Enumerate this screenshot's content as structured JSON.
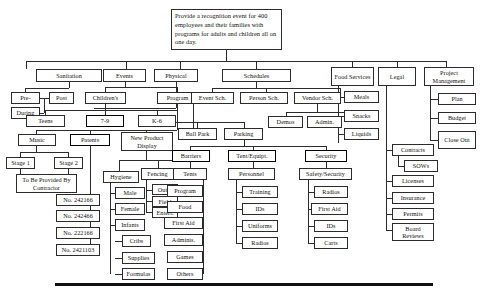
{
  "diagram": {
    "root": {
      "label": "Provide a recognition event for 400 employees and their families with programs for adults and children all on one day."
    },
    "nodes": {
      "sanitation": "Sanitation",
      "sanitation_pre": "Pre-",
      "sanitation_during": "During",
      "sanitation_post": "Post",
      "events": "Events",
      "childrens": "Children's",
      "teens": "Teens",
      "age_7_9": "7-9",
      "age_k_6": "K-6",
      "program": "Program",
      "music": "Music",
      "stage1": "Stage 1",
      "stage2": "Stage 2",
      "contractor": "To Be Provided By Contractor",
      "patents": "Patents",
      "patent1": "No. 242166",
      "patent2": "No. 242466",
      "patent3": "No. 222166",
      "patent4": "No. 2421103",
      "hygiene": "Hygiene",
      "male": "Male",
      "female": "Female",
      "infants": "Infants",
      "cribs": "Cribs",
      "supplies": "Supplies",
      "formulas": "Formulas",
      "new_product_display": "New Product Display",
      "fencing": "Fencing",
      "outer": "Outer",
      "field": "Field",
      "entert": "Entert.",
      "physical": "Physical",
      "ball_park": "Ball Park",
      "parking": "Parking",
      "barriers": "Barriers",
      "tents": "Tents",
      "tent_program": "Program",
      "tent_food": "Food",
      "tent_first_aid": "First Aid",
      "tent_adminis": "Adminis.",
      "tent_games": "Games",
      "tent_others": "Others",
      "schedules": "Schedules",
      "event_sch": "Event Sch.",
      "person_sch": "Person Sch.",
      "vendor_sch": "Vendor Sch.",
      "demos": "Demos",
      "admin": "Admin.",
      "tent_equipt": "Tent/Equipt.",
      "personnel": "Personnel",
      "training": "Training",
      "ids": "IDs",
      "uniforms": "Uniforms",
      "radios": "Radios",
      "security": "Security",
      "safety_security": "Safety/Security",
      "sec_radios": "Radios",
      "sec_first_aid": "First Aid",
      "sec_ids": "IDs",
      "sec_carts": "Carts",
      "food_services": "Food Services",
      "meals": "Meals",
      "snacks": "Snacks",
      "liquids": "Liquids",
      "legal": "Legal",
      "contracts": "Contracts",
      "sows": "SOWs",
      "licenses": "Licenses",
      "insurance": "Insurance",
      "permits": "Permits",
      "board_reviews": "Board Reviews",
      "project_management": "Project Management",
      "plan": "Plan",
      "budget": "Budget",
      "close_out": "Close Out"
    },
    "colors": {
      "line": "#2b2b2b",
      "box_border": "#2b2b2b",
      "background": "#ffffff",
      "text": "#111111",
      "rule": "#111111"
    }
  }
}
